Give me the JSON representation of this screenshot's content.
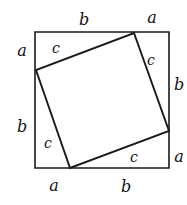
{
  "figure": {
    "type": "geometry-diagram",
    "colors": {
      "background": "#ffffff",
      "stroke": "#1a1a1a",
      "text": "#141414"
    },
    "outer_square": {
      "name": "outer-square",
      "points": "35,32 169,32 169,168 35,168",
      "stroke_width": 1.6
    },
    "inner_square": {
      "name": "inner-square",
      "points": "134,33 169,131 70,168 36,70",
      "stroke_width": 1.9
    },
    "labels": {
      "top_b": {
        "text": "b",
        "x": 84,
        "y": 20
      },
      "top_a": {
        "text": "a",
        "x": 152,
        "y": 18
      },
      "left_a": {
        "text": "a",
        "x": 22,
        "y": 51
      },
      "left_b": {
        "text": "b",
        "x": 22,
        "y": 127
      },
      "right_b": {
        "text": "b",
        "x": 179,
        "y": 85
      },
      "right_a": {
        "text": "a",
        "x": 179,
        "y": 157
      },
      "bottom_a": {
        "text": "a",
        "x": 54,
        "y": 186
      },
      "bottom_b": {
        "text": "b",
        "x": 126,
        "y": 187
      },
      "hyp_top_left": {
        "text": "c",
        "x": 56,
        "y": 48
      },
      "hyp_top_right": {
        "text": "c",
        "x": 151,
        "y": 60
      },
      "hyp_bottom_left": {
        "text": "c",
        "x": 48,
        "y": 143
      },
      "hyp_bottom_right": {
        "text": "c",
        "x": 134,
        "y": 157
      }
    }
  }
}
